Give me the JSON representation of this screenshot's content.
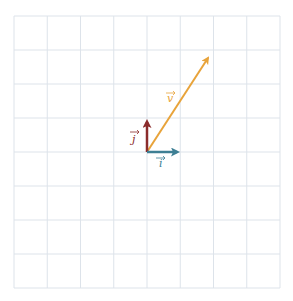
{
  "diagram": {
    "type": "vector-grid",
    "grid": {
      "cols": 8,
      "rows": 8,
      "color": "#dde3ea"
    },
    "origin": {
      "x": 0,
      "y": 0
    },
    "vectors": [
      {
        "name": "i",
        "label": "i",
        "components": [
          1,
          0
        ],
        "color": "#3e7f94"
      },
      {
        "name": "j",
        "label": "j",
        "components": [
          0,
          1
        ],
        "color": "#8b2c2c"
      },
      {
        "name": "v",
        "label": "v",
        "components": [
          2,
          3
        ],
        "color": "#e8a33a"
      }
    ]
  }
}
